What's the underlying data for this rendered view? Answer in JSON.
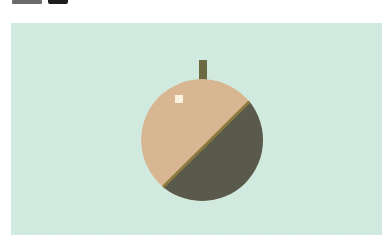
{
  "illustration": {
    "subject": "apple",
    "description": "Flat-design fruit split diagonally into a light half and a dark half, with a stem and a small highlight",
    "colors": {
      "background": "#cfe9df",
      "light_half": "#d8b691",
      "dark_half": "#595a4b",
      "divider": "#8b7a3e",
      "stem": "#6b6a43",
      "highlight": "#fbf2de"
    }
  }
}
